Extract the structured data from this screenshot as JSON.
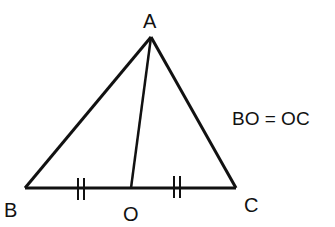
{
  "diagram": {
    "type": "geometry",
    "points": {
      "A": {
        "label": "A",
        "x": 151,
        "y": 37
      },
      "B": {
        "label": "B",
        "x": 25,
        "y": 188
      },
      "C": {
        "label": "C",
        "x": 236,
        "y": 188
      },
      "O": {
        "label": "O",
        "x": 131,
        "y": 188
      }
    },
    "segments": [
      "AB",
      "AC",
      "BC",
      "AO"
    ],
    "equal_marks": [
      "BO",
      "OC"
    ],
    "relation": "BO = OC",
    "line_color": "#111111"
  }
}
